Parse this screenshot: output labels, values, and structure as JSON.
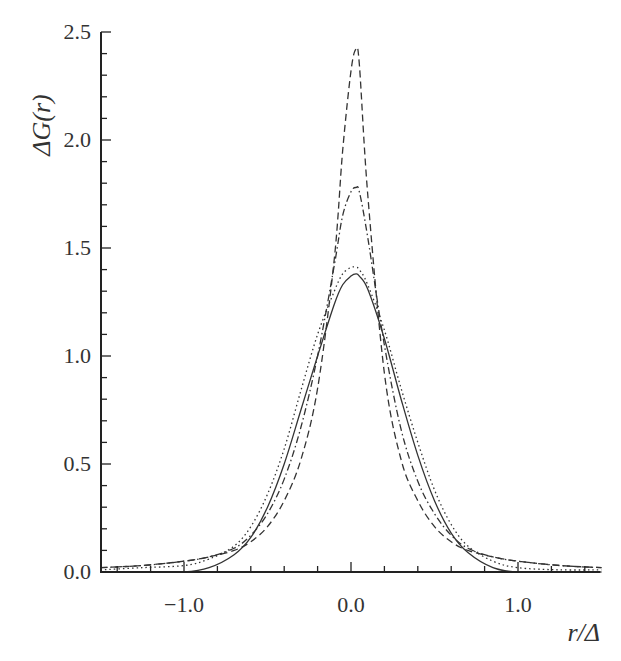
{
  "chart_data": {
    "type": "line",
    "title": "",
    "xlabel": "r/Δ",
    "ylabel": "ΔG(r)",
    "xlim": [
      -1.5,
      1.5
    ],
    "ylim": [
      0.0,
      2.5
    ],
    "grid": false,
    "legend": "none",
    "x_ticks": [
      -1.0,
      0.0,
      1.0
    ],
    "x_tick_labels": [
      "−1.0",
      "0.0",
      "1.0"
    ],
    "y_ticks": [
      0.0,
      0.5,
      1.0,
      1.5,
      2.0,
      2.5
    ],
    "y_tick_labels": [
      "0.0",
      "0.5",
      "1.0",
      "1.5",
      "2.0",
      "2.5"
    ],
    "x": [
      -1.5,
      -1.25,
      -1.0,
      -0.85,
      -0.7,
      -0.6,
      -0.5,
      -0.4,
      -0.3,
      -0.2,
      -0.1,
      -0.05,
      0.0,
      0.03,
      0.05,
      0.1,
      0.2,
      0.3,
      0.4,
      0.5,
      0.6,
      0.7,
      0.85,
      1.0,
      1.25,
      1.5
    ],
    "series": [
      {
        "name": "solid",
        "style": "solid",
        "values": [
          0.0,
          0.0,
          0.0,
          0.02,
          0.08,
          0.16,
          0.3,
          0.5,
          0.75,
          1.0,
          1.24,
          1.33,
          1.37,
          1.38,
          1.37,
          1.31,
          1.08,
          0.8,
          0.54,
          0.33,
          0.18,
          0.09,
          0.02,
          0.0,
          0.0,
          0.0
        ]
      },
      {
        "name": "dotted",
        "style": "dotted",
        "values": [
          0.01,
          0.02,
          0.03,
          0.06,
          0.12,
          0.21,
          0.36,
          0.57,
          0.84,
          1.1,
          1.3,
          1.38,
          1.41,
          1.41,
          1.4,
          1.33,
          1.12,
          0.85,
          0.6,
          0.38,
          0.22,
          0.12,
          0.05,
          0.02,
          0.01,
          0.01
        ]
      },
      {
        "name": "dash-dot",
        "style": "dashdot",
        "values": [
          0.02,
          0.03,
          0.05,
          0.07,
          0.11,
          0.17,
          0.27,
          0.43,
          0.67,
          1.0,
          1.42,
          1.65,
          1.76,
          1.78,
          1.76,
          1.55,
          1.05,
          0.66,
          0.42,
          0.27,
          0.17,
          0.11,
          0.07,
          0.05,
          0.03,
          0.02
        ]
      },
      {
        "name": "dashed",
        "style": "dashed",
        "values": [
          0.02,
          0.03,
          0.05,
          0.07,
          0.1,
          0.14,
          0.21,
          0.33,
          0.52,
          0.85,
          1.45,
          1.95,
          2.32,
          2.42,
          2.35,
          1.75,
          0.92,
          0.52,
          0.33,
          0.21,
          0.14,
          0.1,
          0.07,
          0.05,
          0.03,
          0.02
        ]
      }
    ]
  },
  "axes": {
    "x_title": "r/Δ",
    "y_title": "ΔG(r)"
  }
}
